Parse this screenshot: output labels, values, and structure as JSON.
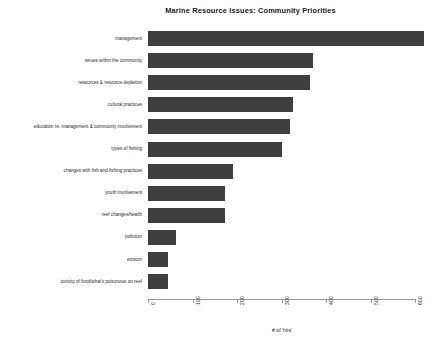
{
  "chart_data": {
    "type": "bar",
    "orientation": "horizontal",
    "title": "Marine Resource Issues: Community Priorities",
    "xlabel": "# of 'hits'",
    "ylabel": "",
    "xlim": [
      0,
      620
    ],
    "xticks": [
      0,
      100,
      200,
      300,
      400,
      500,
      600
    ],
    "grid": false,
    "legend": null,
    "bar_color": "#3f3f3f",
    "background_color": "#ffffff",
    "categories": [
      "management",
      "issues within the community",
      "resources & resource depletion",
      "cultural practices",
      "education re. management & community involvement",
      "types of fishing",
      "changes with fish and fishing practices",
      "youth involvement",
      "reef changes/health",
      "pollution",
      "erosion",
      "toxicity of food/what's poisonous on reef"
    ],
    "values": [
      620,
      370,
      365,
      325,
      318,
      300,
      190,
      172,
      172,
      63,
      45,
      45
    ]
  }
}
